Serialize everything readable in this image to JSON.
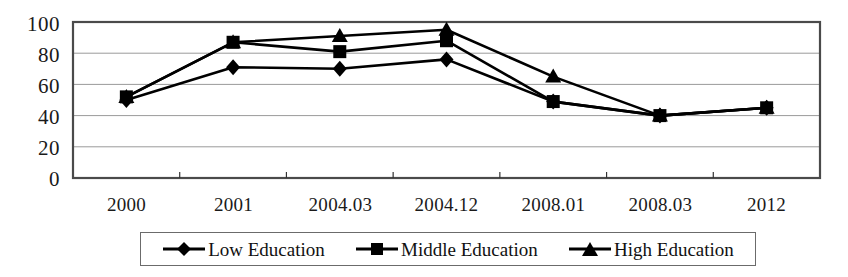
{
  "chart_data": {
    "type": "line",
    "title": "",
    "xlabel": "",
    "ylabel": "",
    "categories": [
      "2000",
      "2001",
      "2004.03",
      "2004.12",
      "2008.01",
      "2008.03",
      "2012"
    ],
    "ylim": [
      0,
      100
    ],
    "yticks": [
      0,
      20,
      40,
      60,
      80,
      100
    ],
    "grid": true,
    "legend_position": "bottom",
    "series": [
      {
        "name": "Low Education",
        "marker": "diamond",
        "color": "#000000",
        "values": [
          50,
          71,
          70,
          76,
          49,
          40,
          45
        ]
      },
      {
        "name": "Middle Education",
        "marker": "square",
        "color": "#000000",
        "values": [
          52,
          87,
          81,
          88,
          49,
          40,
          45
        ]
      },
      {
        "name": "High Education",
        "marker": "triangle",
        "color": "#000000",
        "values": [
          52,
          87,
          91,
          95,
          65,
          40,
          45
        ]
      }
    ]
  },
  "axis": {
    "y_labels": [
      "100",
      "80",
      "60",
      "40",
      "20",
      "0"
    ],
    "x_labels": [
      "2000",
      "2001",
      "2004.03",
      "2004.12",
      "2008.01",
      "2008.03",
      "2012"
    ]
  },
  "legend": {
    "items": [
      {
        "label": "Low Education",
        "marker": "diamond"
      },
      {
        "label": "Middle Education",
        "marker": "square"
      },
      {
        "label": "High Education",
        "marker": "triangle"
      }
    ]
  }
}
